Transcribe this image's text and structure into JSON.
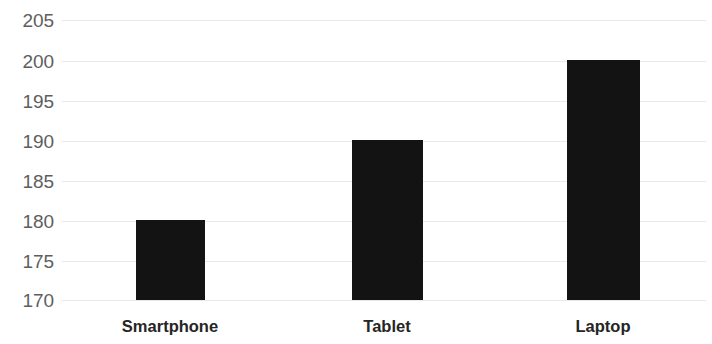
{
  "chart_data": {
    "type": "bar",
    "title": "",
    "subtitle": "",
    "xlabel": "",
    "ylabel": "",
    "categories": [
      "Smartphone",
      "Tablet",
      "Laptop"
    ],
    "values": [
      180,
      190,
      200
    ],
    "ylim": [
      170,
      205
    ],
    "yticks": [
      205,
      200,
      195,
      190,
      185,
      180,
      175,
      170
    ],
    "ytick_labels": [
      "205",
      "200",
      "195",
      "190",
      "185",
      "180",
      "175",
      "170"
    ],
    "grid": true,
    "grid_axis": "y",
    "legend": null,
    "legend_position": "none",
    "bar_color": "#131313",
    "gridline_color": "#e9e9e9",
    "axis_label_color": "#5e5e5e",
    "category_label_color": "#252525",
    "background_color": "#ffffff",
    "bars": [
      {
        "category": "Smartphone",
        "value": 180,
        "center_x": 170,
        "width": 69
      },
      {
        "category": "Tablet",
        "value": 190,
        "center_x": 387,
        "width": 71
      },
      {
        "category": "Laptop",
        "value": 200,
        "center_x": 603,
        "width": 73
      }
    ]
  }
}
